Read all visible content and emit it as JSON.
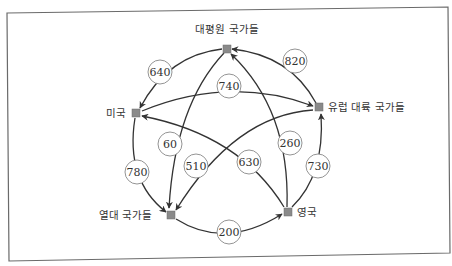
{
  "nodes": [
    {
      "id": "pacific",
      "label": "대평원 국가들"
    },
    {
      "id": "europe",
      "label": "유럽 대륙 국가들"
    },
    {
      "id": "uk",
      "label": "영국"
    },
    {
      "id": "tropical",
      "label": "열대 국가들"
    },
    {
      "id": "us",
      "label": "미국"
    }
  ],
  "edges": [
    {
      "from": "pacific",
      "to": "us",
      "value": "640"
    },
    {
      "from": "europe",
      "to": "pacific",
      "value": "820"
    },
    {
      "from": "us",
      "to": "europe",
      "value": "740"
    },
    {
      "from": "pacific",
      "to": "tropical",
      "value": "60"
    },
    {
      "from": "europe",
      "to": "tropical",
      "value": "510"
    },
    {
      "from": "uk",
      "to": "us",
      "value": "630"
    },
    {
      "from": "uk",
      "to": "pacific",
      "value": "260"
    },
    {
      "from": "uk",
      "to": "europe",
      "value": "730"
    },
    {
      "from": "us",
      "to": "tropical",
      "value": "780"
    },
    {
      "from": "tropical",
      "to": "uk",
      "value": "200"
    }
  ],
  "colors": {
    "node": "#8a8a8a",
    "edge": "#333333",
    "frame": "#6a6a6a"
  }
}
